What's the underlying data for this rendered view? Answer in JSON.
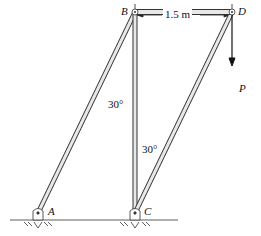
{
  "diagram": {
    "type": "truss-frame",
    "dimension": "1.5 m",
    "labels": {
      "A": "A",
      "B": "B",
      "C": "C",
      "D": "D",
      "P": "P"
    },
    "angles": {
      "at_B": "30°",
      "at_C": "30°"
    },
    "colors": {
      "member_fill": "#e8e8e8",
      "member_stroke": "#333333",
      "line": "#222222"
    }
  }
}
